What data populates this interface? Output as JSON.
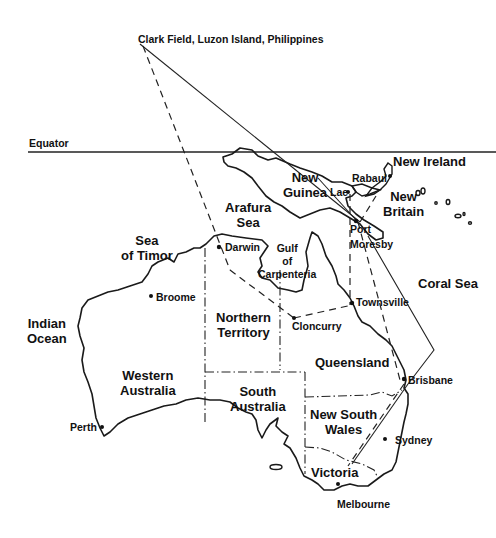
{
  "title": "Clark Field, Luzon Island, Philippines",
  "equator_label": "Equator",
  "seas": {
    "indian_ocean": "Indian\nOcean",
    "sea_of_timor": "Sea\nof Timor",
    "arafura_sea": "Arafura\nSea",
    "gulf_of_carpenteria": "Gulf\nof\nCarpenteria",
    "coral_sea": "Coral Sea"
  },
  "islands": {
    "new_guinea": "New\nGuinea",
    "new_ireland": "New Ireland",
    "new_britain": "New\nBritain"
  },
  "states": {
    "western_australia": "Western\nAustralia",
    "northern_territory": "Northern\nTerritory",
    "south_australia": "South\nAustralia",
    "queensland": "Queensland",
    "new_south_wales": "New South\nWales",
    "victoria": "Victoria"
  },
  "cities": {
    "darwin": "Darwin",
    "broome": "Broome",
    "perth": "Perth",
    "cloncurry": "Cloncurry",
    "townsville": "Townsville",
    "brisbane": "Brisbane",
    "sydney": "Sydney",
    "melbourne": "Melbourne",
    "lae": "Lae",
    "rabaul": "Rabaul",
    "port_moresby": "Port\nMoresby"
  }
}
